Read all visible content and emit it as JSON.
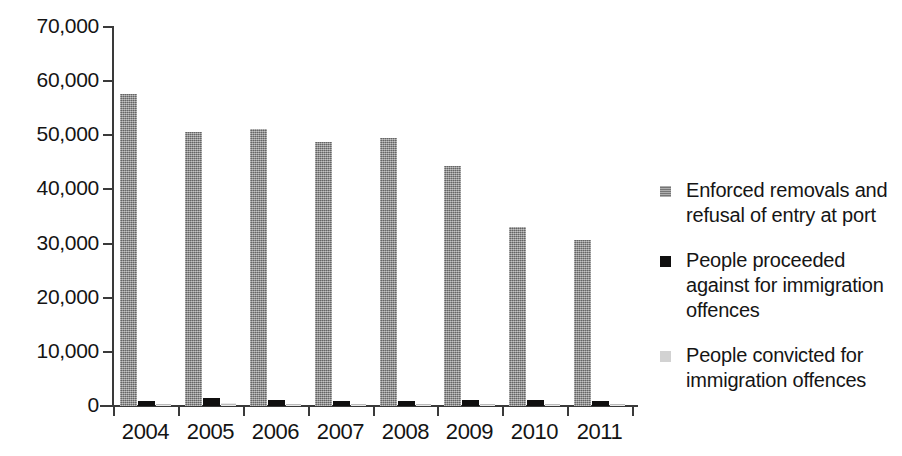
{
  "chart_data": {
    "type": "bar",
    "title": "",
    "subtitle": "",
    "xlabel": "",
    "ylabel": "",
    "categories": [
      "2004",
      "2005",
      "2006",
      "2007",
      "2008",
      "2009",
      "2010",
      "2011"
    ],
    "series": [
      {
        "name": "Enforced removals and refusal of entry at port",
        "color": "#8b8b8b",
        "values": [
          57600,
          50600,
          51200,
          48800,
          49500,
          44300,
          33100,
          30600
        ]
      },
      {
        "name": "People proceeded against for immigration offences",
        "color": "#100f0f",
        "values": [
          1000,
          1400,
          1200,
          1000,
          1000,
          1200,
          1100,
          900
        ]
      },
      {
        "name": "People convicted for immigration offences",
        "color": "#d2d2d2",
        "values": [
          300,
          500,
          400,
          300,
          300,
          400,
          300,
          300
        ]
      }
    ],
    "ylim": [
      0,
      70000
    ],
    "ytick_labels": [
      "70,000",
      "60,000",
      "50,000",
      "40,000",
      "30,000",
      "20,000",
      "10,000",
      "0"
    ],
    "ytick_values": [
      70000,
      60000,
      50000,
      40000,
      30000,
      20000,
      10000,
      0
    ],
    "grid": false,
    "legend_position": "right"
  },
  "legend": {
    "entries": [
      {
        "label": "Enforced removals and refusal of entry at port",
        "swatch": "s1"
      },
      {
        "label": "People proceeded against for immigration offences",
        "swatch": "s2"
      },
      {
        "label": "People convicted for immigration offences",
        "swatch": "s3"
      }
    ]
  }
}
